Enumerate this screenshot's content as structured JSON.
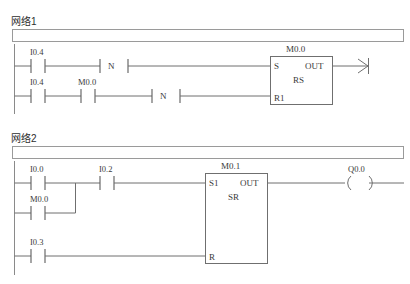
{
  "page": {
    "background": "#ffffff",
    "line_color": "#6f6f6f",
    "text_color": "#3a3a3a"
  },
  "networks": [
    {
      "title": "网络1",
      "comment": "",
      "rungs": [
        {
          "id": "rung-1",
          "contacts": [
            {
              "label": "I0.4",
              "type": "no"
            },
            {
              "label": "",
              "type": "n-edge",
              "glyph": "N"
            }
          ],
          "block": {
            "name": "M0.0",
            "type": "RS",
            "inputs": [
              "S",
              "R1"
            ],
            "outputs": [
              "OUT"
            ]
          },
          "terminator": {
            "type": "connector-arrow",
            "label": ""
          }
        },
        {
          "id": "rung-2",
          "contacts": [
            {
              "label": "I0.4",
              "type": "no"
            },
            {
              "label": "M0.0",
              "type": "no"
            },
            {
              "label": "",
              "type": "n-edge",
              "glyph": "N"
            }
          ],
          "target_input": "R1"
        }
      ]
    },
    {
      "title": "网络2",
      "comment": "",
      "rungs": [
        {
          "id": "rung-3",
          "contacts": [
            {
              "label": "I0.0",
              "type": "no"
            },
            {
              "label": "I0.2",
              "type": "no"
            }
          ],
          "block": {
            "name": "M0.1",
            "type": "SR",
            "inputs": [
              "S1",
              "R"
            ],
            "outputs": [
              "OUT"
            ]
          },
          "coil": {
            "label": "Q0.0",
            "type": "output-coil"
          }
        },
        {
          "id": "rung-4-branch",
          "contacts": [
            {
              "label": "M0.0",
              "type": "no"
            }
          ],
          "is_branch": true
        },
        {
          "id": "rung-5",
          "contacts": [
            {
              "label": "I0.3",
              "type": "no"
            }
          ],
          "target_input": "R"
        }
      ]
    }
  ]
}
